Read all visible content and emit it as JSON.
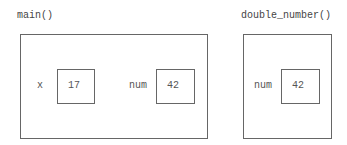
{
  "frames": [
    {
      "title": "main()",
      "variables": [
        {
          "name": "x",
          "value": "17"
        },
        {
          "name": "num",
          "value": "42"
        }
      ]
    },
    {
      "title": "double_number()",
      "variables": [
        {
          "name": "num",
          "value": "42"
        }
      ]
    }
  ]
}
